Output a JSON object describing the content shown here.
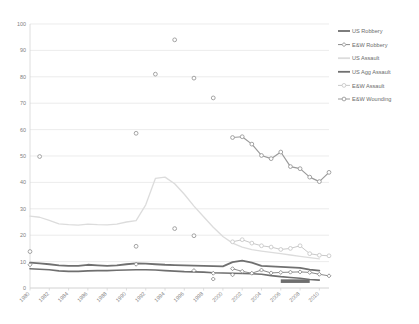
{
  "chart_data": {
    "type": "line",
    "title": "",
    "xlabel": "",
    "ylabel": "",
    "xlim": [
      1980,
      2011
    ],
    "ylim": [
      0,
      100
    ],
    "ytick_step": 10,
    "grid": true,
    "legend_position": "right",
    "xticks": [
      "1980",
      "1982",
      "1984",
      "1986",
      "1988",
      "1990",
      "1992",
      "1994",
      "1996",
      "1998",
      "2000",
      "2002",
      "2004",
      "2006",
      "2008",
      "2010"
    ],
    "yticks": [
      "0",
      "10",
      "20",
      "30",
      "40",
      "50",
      "60",
      "70",
      "80",
      "90",
      "100"
    ],
    "colors": {
      "us_robbery": "#6f6f6f",
      "ew_robbery": "#8a8a8a",
      "us_assault": "#dcdcdc",
      "us_agg_assault": "#707070",
      "ew_assault": "#c9c9c9",
      "ew_wounding": "#9a9a9a",
      "grid": "#e4e4e4",
      "axis": "#d6d6d6",
      "text": "#808080"
    },
    "series": [
      {
        "name": "US Robbery",
        "style": "line",
        "color": "#6f6f6f",
        "width": 1.6,
        "x": [
          1980,
          1981,
          1982,
          1983,
          1984,
          1985,
          1986,
          1987,
          1988,
          1989,
          1990,
          1991,
          1992,
          1993,
          1994,
          1995,
          1996,
          1997,
          1998,
          1999,
          2000,
          2001,
          2002,
          2003,
          2004,
          2005,
          2006,
          2007,
          2008,
          2009,
          2010
        ],
        "values": [
          7.3,
          7.1,
          6.9,
          6.5,
          6.3,
          6.3,
          6.5,
          6.6,
          6.6,
          6.7,
          6.8,
          6.9,
          6.9,
          6.8,
          6.6,
          6.4,
          6.2,
          6.1,
          6.0,
          5.8,
          5.7,
          5.6,
          5.5,
          5.4,
          5.2,
          4.7,
          4.3,
          4.0,
          3.7,
          3.2,
          3.0
        ]
      },
      {
        "name": "E&W Robbery",
        "style": "line-marker",
        "marker": "diamond",
        "color": "#8a8a8a",
        "width": 1.0,
        "x": [
          2001,
          2002,
          2003,
          2004,
          2005,
          2006,
          2007,
          2008,
          2009,
          2010,
          2011
        ],
        "values": [
          7.3,
          6.3,
          5.6,
          6.8,
          5.7,
          5.9,
          6.0,
          6.1,
          5.9,
          5.2,
          4.6
        ]
      },
      {
        "name": "US Assault",
        "style": "line",
        "color": "#dcdcdc",
        "width": 1.3,
        "x": [
          1980,
          1981,
          1982,
          1983,
          1984,
          1985,
          1986,
          1987,
          1988,
          1989,
          1990,
          1991,
          1992,
          1993,
          1994,
          1995,
          1996,
          1997,
          1998,
          1999,
          2000,
          2001,
          2002,
          2003,
          2004,
          2005,
          2006,
          2007,
          2008,
          2009,
          2010
        ],
        "values": [
          27.2,
          26.8,
          25.6,
          24.3,
          24.0,
          23.8,
          24.2,
          24.0,
          23.9,
          24.2,
          25.0,
          25.5,
          31.5,
          41.5,
          42.0,
          39.5,
          35.5,
          31.0,
          27.0,
          23.0,
          19.5,
          17.0,
          15.5,
          14.5,
          14.0,
          13.5,
          13.0,
          12.5,
          12.0,
          11.5,
          11.0
        ]
      },
      {
        "name": "US Agg Assault",
        "style": "line",
        "color": "#707070",
        "width": 1.8,
        "x": [
          1980,
          1981,
          1982,
          1983,
          1984,
          1985,
          1986,
          1987,
          1988,
          1989,
          1990,
          1991,
          1992,
          1993,
          1994,
          1995,
          1996,
          1997,
          1998,
          1999,
          2000,
          2001,
          2002,
          2003,
          2004,
          2005,
          2006,
          2007,
          2008,
          2009,
          2010
        ],
        "values": [
          9.6,
          9.3,
          9.0,
          8.6,
          8.4,
          8.4,
          8.8,
          8.6,
          8.4,
          8.6,
          9.0,
          9.3,
          9.2,
          9.0,
          8.8,
          8.7,
          8.6,
          8.5,
          8.4,
          8.3,
          8.2,
          9.8,
          10.4,
          9.6,
          8.4,
          8.2,
          8.0,
          7.8,
          7.6,
          7.0,
          6.6
        ]
      },
      {
        "name": "E&W Assault",
        "style": "line-marker",
        "marker": "circle",
        "color": "#c9c9c9",
        "width": 1.0,
        "x": [
          2001,
          2002,
          2003,
          2004,
          2005,
          2006,
          2007,
          2008,
          2009,
          2010,
          2011
        ],
        "values": [
          17.5,
          18.3,
          17.0,
          16.0,
          15.5,
          14.6,
          15.0,
          16.0,
          13.0,
          12.4,
          12.2
        ]
      },
      {
        "name": "E&W Wounding",
        "style": "line-marker",
        "marker": "circle",
        "color": "#9a9a9a",
        "width": 1.2,
        "x": [
          2001,
          2002,
          2003,
          2004,
          2005,
          2006,
          2007,
          2008,
          2009,
          2010,
          2011
        ],
        "values": [
          57.0,
          57.3,
          54.5,
          50.2,
          49.0,
          51.5,
          46.0,
          45.2,
          42.0,
          40.3,
          43.8
        ]
      }
    ],
    "scatter_points": [
      {
        "series": "E&W Assault",
        "x": 1981,
        "y": 49.8,
        "marker": "circle"
      },
      {
        "series": "E&W Assault",
        "x": 1991,
        "y": 58.6,
        "marker": "circle"
      },
      {
        "series": "E&W Assault",
        "x": 1995,
        "y": 94.0,
        "marker": "circle"
      },
      {
        "series": "E&W Assault",
        "x": 1993,
        "y": 81.0,
        "marker": "circle"
      },
      {
        "series": "E&W Assault",
        "x": 1997,
        "y": 79.5,
        "marker": "circle"
      },
      {
        "series": "E&W Assault",
        "x": 1999,
        "y": 72.0,
        "marker": "circle"
      },
      {
        "series": "E&W Assault",
        "x": 1995,
        "y": 22.5,
        "marker": "circle"
      },
      {
        "series": "E&W Assault",
        "x": 1997,
        "y": 19.8,
        "marker": "circle"
      },
      {
        "series": "E&W Assault",
        "x": 1991,
        "y": 15.8,
        "marker": "circle"
      },
      {
        "series": "E&W Assault",
        "x": 1980,
        "y": 13.8,
        "marker": "circle"
      },
      {
        "series": "E&W Robbery",
        "x": 1980,
        "y": 8.8,
        "marker": "diamond"
      },
      {
        "series": "E&W Robbery",
        "x": 1991,
        "y": 9.0,
        "marker": "diamond"
      },
      {
        "series": "E&W Robbery",
        "x": 1997,
        "y": 6.6,
        "marker": "diamond"
      },
      {
        "series": "E&W Robbery",
        "x": 1999,
        "y": 5.6,
        "marker": "diamond"
      },
      {
        "series": "E&W Robbery",
        "x": 1999,
        "y": 3.4,
        "marker": "diamond"
      },
      {
        "series": "E&W Robbery",
        "x": 2001,
        "y": 5.0,
        "marker": "diamond"
      }
    ],
    "highlight_bar": {
      "x_start": 2006,
      "x_end": 2009,
      "y": 2.6,
      "color": "#6f6f6f"
    }
  },
  "legend": {
    "items": [
      {
        "label": "US Robbery",
        "style": "line",
        "color": "#6f6f6f"
      },
      {
        "label": "E&W Robbery",
        "style": "line-marker",
        "color": "#8a8a8a",
        "marker": "diamond"
      },
      {
        "label": "US Assault",
        "style": "line",
        "color": "#dcdcdc"
      },
      {
        "label": "US Agg Assault",
        "style": "line",
        "color": "#707070"
      },
      {
        "label": "E&W Assault",
        "style": "line-marker",
        "color": "#c9c9c9",
        "marker": "circle"
      },
      {
        "label": "E&W Wounding",
        "style": "line-marker",
        "color": "#9a9a9a",
        "marker": "circle"
      }
    ]
  }
}
